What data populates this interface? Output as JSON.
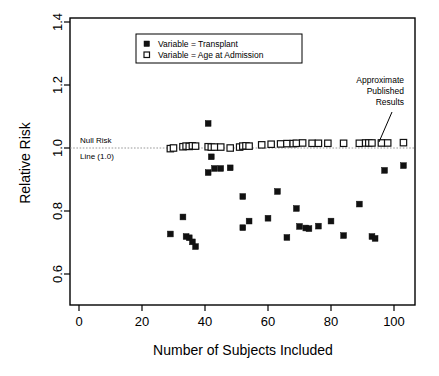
{
  "chart_data": {
    "type": "scatter",
    "title": "",
    "xlabel": "Number of Subjects Included",
    "ylabel": "Relative Risk",
    "xlim": [
      0,
      110
    ],
    "ylim": [
      0.45,
      1.43
    ],
    "xticks": [
      0,
      20,
      40,
      60,
      80,
      100
    ],
    "xtick_labels": [
      "0",
      "20",
      "40",
      "60",
      "80",
      "100"
    ],
    "yticks": [
      0.6,
      0.8,
      1.0,
      1.2,
      1.4
    ],
    "ytick_labels": [
      "0.6",
      "0.8",
      "1.0",
      "1.2",
      "1.4"
    ],
    "grid": false,
    "legend_position": "top-center",
    "reference_line": {
      "value": 1.0,
      "orientation": "horizontal",
      "style": "dotted",
      "label_line_1": "Null Risk",
      "label_line_2": "Line (1.0)"
    },
    "annotations": [
      {
        "text_line_1": "Approximate",
        "text_line_2": "Published",
        "text_line_3": "Results",
        "points_to_x": 96,
        "points_to_y": 1.015
      }
    ],
    "series": [
      {
        "name": "Variable = Transplant",
        "marker": "filled-square",
        "color": "#111111",
        "points": [
          [
            29,
            0.472
          ],
          [
            29,
            0.727
          ],
          [
            33,
            0.781
          ],
          [
            34,
            0.719
          ],
          [
            35,
            0.715
          ],
          [
            36,
            0.702
          ],
          [
            37,
            0.687
          ],
          [
            41,
            1.078
          ],
          [
            41,
            0.922
          ],
          [
            42,
            0.972
          ],
          [
            43,
            0.935
          ],
          [
            45,
            0.935
          ],
          [
            48,
            0.937
          ],
          [
            52,
            0.846
          ],
          [
            52,
            0.747
          ],
          [
            54,
            0.768
          ],
          [
            60,
            0.777
          ],
          [
            63,
            0.862
          ],
          [
            66,
            0.716
          ],
          [
            69,
            0.808
          ],
          [
            70,
            0.751
          ],
          [
            72,
            0.746
          ],
          [
            73,
            0.744
          ],
          [
            76,
            0.752
          ],
          [
            80,
            0.768
          ],
          [
            84,
            0.722
          ],
          [
            89,
            0.822
          ],
          [
            93,
            0.719
          ],
          [
            94,
            0.713
          ],
          [
            96,
            1.016
          ],
          [
            97,
            0.929
          ],
          [
            103,
            0.944
          ]
        ]
      },
      {
        "name": "Variable = Age at Admission",
        "marker": "open-square",
        "color": "#111111",
        "points": [
          [
            29,
            0.998
          ],
          [
            30,
            1.0
          ],
          [
            33,
            1.004
          ],
          [
            34,
            1.006
          ],
          [
            35,
            1.005
          ],
          [
            36,
            1.007
          ],
          [
            37,
            1.006
          ],
          [
            41,
            1.004
          ],
          [
            42,
            1.003
          ],
          [
            43,
            1.003
          ],
          [
            45,
            1.003
          ],
          [
            48,
            1.0
          ],
          [
            51,
            1.003
          ],
          [
            52,
            1.006
          ],
          [
            53,
            1.007
          ],
          [
            54,
            1.006
          ],
          [
            58,
            1.01
          ],
          [
            61,
            1.012
          ],
          [
            64,
            1.013
          ],
          [
            66,
            1.014
          ],
          [
            68,
            1.014
          ],
          [
            69,
            1.015
          ],
          [
            71,
            1.016
          ],
          [
            74,
            1.015
          ],
          [
            76,
            1.015
          ],
          [
            79,
            1.015
          ],
          [
            84,
            1.015
          ],
          [
            89,
            1.015
          ],
          [
            91,
            1.016
          ],
          [
            92,
            1.016
          ],
          [
            93,
            1.016
          ],
          [
            96,
            1.016
          ],
          [
            98,
            1.016
          ],
          [
            103,
            1.017
          ]
        ]
      }
    ]
  },
  "legend": {
    "entries": [
      {
        "label": "Variable = Transplant",
        "marker": "filled-square"
      },
      {
        "label": "Variable = Age at Admission",
        "marker": "open-square"
      }
    ]
  }
}
